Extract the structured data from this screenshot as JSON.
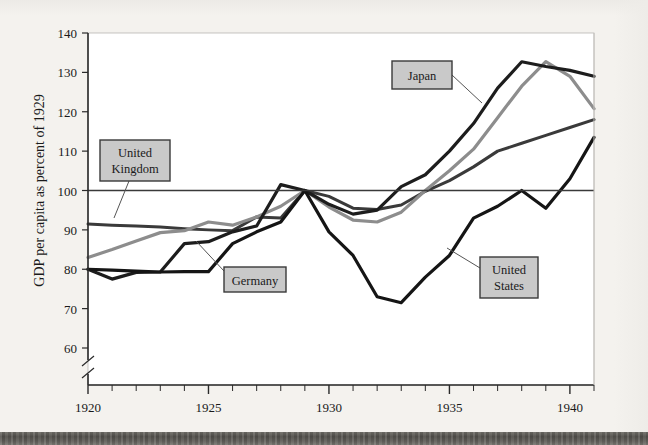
{
  "chart_data": {
    "type": "line",
    "title": "",
    "subtitle": "",
    "xlabel": "",
    "ylabel": "GDP per capita as percent of 1929",
    "xlim": [
      1920,
      1941
    ],
    "ylim": [
      57,
      140
    ],
    "ybreak": true,
    "grid": false,
    "legend_position": "inline-callouts",
    "reference_line": {
      "y": 100,
      "label": "100"
    },
    "x_tick_labels": [
      "1920",
      "1925",
      "1930",
      "1935",
      "1940"
    ],
    "x_tick_values": [
      1920,
      1925,
      1930,
      1935,
      1940
    ],
    "x_minor_step": 1,
    "y_tick_labels": [
      "140",
      "130",
      "120",
      "110",
      "100",
      "90",
      "80",
      "70",
      "60"
    ],
    "y_tick_values": [
      140,
      130,
      120,
      110,
      100,
      90,
      80,
      70,
      60
    ],
    "x": [
      1920,
      1921,
      1922,
      1923,
      1924,
      1925,
      1926,
      1927,
      1928,
      1929,
      1930,
      1931,
      1932,
      1933,
      1934,
      1935,
      1936,
      1937,
      1938,
      1939,
      1940,
      1941
    ],
    "series": [
      {
        "name": "United Kingdom",
        "color": "#3a3a3a",
        "width": 3.0,
        "values": [
          91.5,
          91.2,
          91.0,
          90.7,
          90.3,
          90.0,
          89.8,
          93.3,
          93.0,
          100.0,
          98.5,
          95.5,
          95.2,
          96.3,
          99.8,
          102.5,
          106.0,
          110.0,
          112.0,
          114.0,
          116.0,
          118.0
        ]
      },
      {
        "name": "Germany",
        "color": "#8d8d8d",
        "width": 3.2,
        "values": [
          83.0,
          85.0,
          87.2,
          89.3,
          89.8,
          92.0,
          91.2,
          93.3,
          96.0,
          100.0,
          95.8,
          92.5,
          92.0,
          94.5,
          100.0,
          105.0,
          110.5,
          118.5,
          126.5,
          132.7,
          129.0,
          120.8
        ]
      },
      {
        "name": "Japan",
        "color": "#1d1d1d",
        "width": 3.2,
        "values": [
          80.0,
          77.5,
          79.2,
          79.3,
          86.5,
          87.0,
          89.5,
          91.0,
          101.5,
          100.0,
          96.5,
          94.0,
          95.0,
          101.0,
          104.0,
          110.0,
          117.0,
          126.0,
          132.7,
          131.5,
          130.5,
          129.0
        ]
      },
      {
        "name": "United States",
        "color": "#151515",
        "width": 3.2,
        "values": [
          80.0,
          79.8,
          79.5,
          79.3,
          79.4,
          79.4,
          86.5,
          89.5,
          92.0,
          100.0,
          89.5,
          83.5,
          73.0,
          71.5,
          78.0,
          83.5,
          93.0,
          96.0,
          100.0,
          95.5,
          103.0,
          113.5
        ]
      }
    ],
    "annotations": [
      {
        "id": "uk",
        "label_line1": "United",
        "label_line2": "Kingdom",
        "box": {
          "x": 100,
          "y": 140,
          "w": 70,
          "h": 41
        },
        "leader": {
          "x1": 129,
          "y1": 181,
          "x2": 114,
          "y2": 218
        }
      },
      {
        "id": "germany",
        "label_line1": "Germany",
        "label_line2": "",
        "box": {
          "x": 224,
          "y": 267,
          "w": 62,
          "h": 25
        },
        "leader": {
          "x1": 224,
          "y1": 271,
          "x2": 196,
          "y2": 241
        }
      },
      {
        "id": "japan",
        "label_line1": "Japan",
        "label_line2": "",
        "box": {
          "x": 392,
          "y": 61,
          "w": 60,
          "h": 28
        },
        "leader": {
          "x1": 452,
          "y1": 75,
          "x2": 482,
          "y2": 103
        }
      },
      {
        "id": "us",
        "label_line1": "United",
        "label_line2": "States",
        "box": {
          "x": 480,
          "y": 257,
          "w": 58,
          "h": 41
        },
        "leader": {
          "x1": 480,
          "y1": 268,
          "x2": 447,
          "y2": 248
        }
      }
    ]
  },
  "figure": {
    "plot_frame": {
      "left": 88,
      "top": 33,
      "right": 594,
      "bottom": 385
    },
    "colors": {
      "page_background": "#f4f2ee",
      "plot_background": "#ffffff",
      "axis": "#2a2a2a",
      "callout_fill": "#c9c9c9",
      "callout_border": "#3a3a3a",
      "text": "#1a1a1a"
    }
  }
}
